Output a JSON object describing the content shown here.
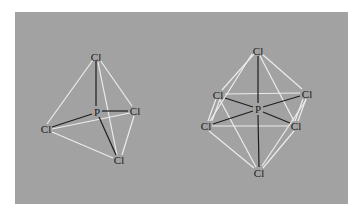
{
  "figure": {
    "background_color": "#a2a2a2",
    "edge_color": "#ececec",
    "bond_color": "#1e1e1e",
    "molecules": [
      {
        "name": "tetrahedral",
        "center": {
          "label": "P",
          "x": 97,
          "y": 112
        },
        "ligands": [
          {
            "label": "Cl",
            "x": 96,
            "y": 57
          },
          {
            "label": "Cl",
            "x": 135,
            "y": 111
          },
          {
            "label": "Cl",
            "x": 46,
            "y": 129
          },
          {
            "label": "Cl",
            "x": 119,
            "y": 160
          }
        ]
      },
      {
        "name": "octahedral",
        "center": {
          "label": "P",
          "x": 258,
          "y": 109
        },
        "ligands": [
          {
            "label": "Cl",
            "x": 258,
            "y": 51
          },
          {
            "label": "Cl",
            "x": 218,
            "y": 95
          },
          {
            "label": "Cl",
            "x": 307,
            "y": 94
          },
          {
            "label": "Cl",
            "x": 206,
            "y": 126
          },
          {
            "label": "Cl",
            "x": 296,
            "y": 126
          },
          {
            "label": "Cl",
            "x": 259,
            "y": 173
          }
        ]
      }
    ]
  }
}
